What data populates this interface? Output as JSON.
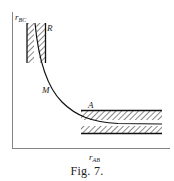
{
  "figure": {
    "caption": "Fig. 7.",
    "y_axis_label": {
      "base": "r",
      "sub": "BC"
    },
    "x_axis_label": {
      "base": "r",
      "sub": "AB"
    },
    "labels": {
      "R": "R",
      "M": "M",
      "A": "A"
    }
  },
  "colors": {
    "ink": "#222222",
    "background": "#ffffff"
  }
}
